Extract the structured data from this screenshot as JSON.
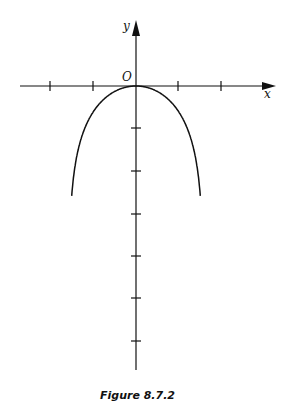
{
  "caption": "Figure 8.7.2",
  "colors": {
    "ink": "#111111",
    "background": "#ffffff"
  },
  "chart_data": {
    "type": "line",
    "title": "Figure 8.7.2",
    "xlabel": "x",
    "ylabel": "y",
    "origin_label": "O",
    "function": "y = ln(cos x)",
    "x_ticks": [
      -2,
      -1,
      1,
      2
    ],
    "y_ticks": [
      -1,
      -2,
      -3,
      -4,
      -5,
      -6
    ],
    "xlim": [
      -2.0,
      3.2
    ],
    "ylim": [
      -6.7,
      2
    ],
    "grid": false,
    "series": [
      {
        "name": "curve",
        "x": [
          -1.5,
          -1.4,
          -1.2,
          -1.0,
          -0.8,
          -0.5,
          -0.25,
          0,
          0.25,
          0.5,
          0.8,
          1.0,
          1.2,
          1.4,
          1.5
        ],
        "y": [
          -2.65,
          -1.78,
          -1.01,
          -0.62,
          -0.36,
          -0.13,
          -0.03,
          0,
          -0.03,
          -0.13,
          -0.36,
          -0.62,
          -1.01,
          -1.78,
          -2.65
        ]
      }
    ]
  }
}
